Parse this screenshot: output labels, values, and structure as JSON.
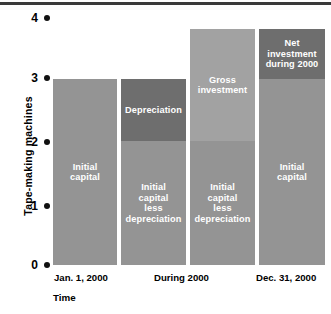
{
  "chart_data": {
    "type": "bar",
    "title": "",
    "subtitle": "",
    "xlabel": "Time",
    "ylabel": "Tape-making machines",
    "ylim": [
      0,
      4
    ],
    "yticks": [
      0,
      1,
      2,
      3,
      4
    ],
    "ytick_labels": [
      "0",
      "1",
      "2",
      "3",
      "4"
    ],
    "grid": false,
    "legend": "none",
    "categories": [
      "Jan. 1, 2000",
      "During 2000",
      "Dec. 31, 2000"
    ],
    "bars": [
      {
        "name": "capital-jan-1",
        "category": "Jan. 1, 2000",
        "segments": [
          {
            "label": "Initial\ncapital",
            "from": 0,
            "to": 3,
            "value": 3,
            "color": "#949494"
          }
        ]
      },
      {
        "name": "capital-depreciation",
        "category": "During 2000",
        "segments": [
          {
            "label": "Initial\ncapital\nless\ndepreciation",
            "from": 0,
            "to": 2,
            "value": 2,
            "color": "#949494"
          },
          {
            "label": "Depreciation",
            "from": 2,
            "to": 3,
            "value": 1,
            "color": "#6e6e6e"
          }
        ]
      },
      {
        "name": "capital-gross-investment",
        "category": "During 2000",
        "segments": [
          {
            "label": "Initial\ncapital\nless\ndepreciation",
            "from": 0,
            "to": 2,
            "value": 2,
            "color": "#949494"
          },
          {
            "label": "Gross\ninvestment",
            "from": 2,
            "to": 3.8,
            "value": 1.8,
            "color": "#a2a2a2"
          }
        ]
      },
      {
        "name": "capital-dec-31",
        "category": "Dec. 31, 2000",
        "segments": [
          {
            "label": "Initial\ncapital",
            "from": 0,
            "to": 3,
            "value": 3,
            "color": "#949494"
          },
          {
            "label": "Net\ninvestment\nduring 2000",
            "from": 3,
            "to": 3.8,
            "value": 0.8,
            "color": "#6e6e6e"
          }
        ]
      }
    ],
    "colors": {
      "capital": "#949494",
      "depreciation": "#6e6e6e",
      "gross_investment": "#a2a2a2",
      "net_investment": "#6e6e6e",
      "text_on_bar": "#ffffff",
      "axis_text": "#000000",
      "top_rule": "#3a3a3a"
    }
  },
  "axis": {
    "y_title": "Tape-making machines",
    "x_title": "Time",
    "y_ticks": [
      "4",
      "3",
      "2",
      "1",
      "0"
    ],
    "x_labels": [
      "Jan. 1, 2000",
      "During 2000",
      "Dec. 31, 2000"
    ]
  },
  "labels": {
    "initial_capital": "Initial\ncapital",
    "initial_capital_less_depreciation": "Initial\ncapital\nless\ndepreciation",
    "depreciation": "Depreciation",
    "gross_investment": "Gross\ninvestment",
    "net_investment": "Net\ninvestment\nduring 2000",
    "initial_capital_4": "Initial\ncapital"
  }
}
